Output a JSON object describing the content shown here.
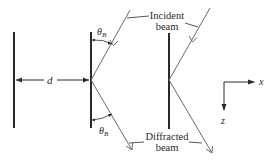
{
  "diagram": {
    "type": "bragg-diffraction",
    "labels": {
      "incident_line1": "Incident",
      "incident_line2": "beam",
      "diffracted_line1": "Diffracted",
      "diffracted_line2": "beam",
      "spacing": "d",
      "theta_main": "θ",
      "theta_sub": "B",
      "axis_x": "x",
      "axis_z": "z"
    },
    "colors": {
      "plane": "#2a2a2a",
      "beam": "#6a6a6a",
      "text": "#2a2a2a"
    },
    "planes": [
      {
        "x": 14,
        "y1": 32,
        "y2": 128
      },
      {
        "x": 91,
        "y1": 32,
        "y2": 128
      },
      {
        "x": 169,
        "y1": 33,
        "y2": 129
      }
    ]
  }
}
